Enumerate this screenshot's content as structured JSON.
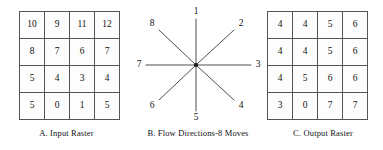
{
  "figure": {
    "panels": [
      {
        "id": "input",
        "caption": "A. Input Raster",
        "type": "raster",
        "rows": [
          [
            "10",
            "9",
            "11",
            "12"
          ],
          [
            "8",
            "7",
            "6",
            "7"
          ],
          [
            "5",
            "4",
            "3",
            "4"
          ],
          [
            "5",
            "0",
            "1",
            "5"
          ]
        ]
      },
      {
        "id": "flow",
        "caption": "B. Flow Directions-8 Moves",
        "type": "direction-star",
        "directions": [
          {
            "label": "1",
            "angle_deg": 90,
            "ray": "long"
          },
          {
            "label": "2",
            "angle_deg": 45,
            "ray": "short"
          },
          {
            "label": "3",
            "angle_deg": 0,
            "ray": "long"
          },
          {
            "label": "4",
            "angle_deg": -45,
            "ray": "short"
          },
          {
            "label": "5",
            "angle_deg": -90,
            "ray": "long"
          },
          {
            "label": "6",
            "angle_deg": 225,
            "ray": "short"
          },
          {
            "label": "7",
            "angle_deg": 180,
            "ray": "long"
          },
          {
            "label": "8",
            "angle_deg": 135,
            "ray": "short"
          }
        ]
      },
      {
        "id": "output",
        "caption": "C. Output Raster",
        "type": "raster",
        "rows": [
          [
            "4",
            "4",
            "5",
            "6"
          ],
          [
            "4",
            "4",
            "5",
            "6"
          ],
          [
            "4",
            "5",
            "6",
            "6"
          ],
          [
            "3",
            "0",
            "7",
            "7"
          ]
        ]
      }
    ],
    "colors": {
      "background": "#ffffff",
      "grid_line": "#555555",
      "grid_border": "#3b3b3b",
      "ray_stroke": "#3a3a3a",
      "hub_fill": "#1a1a1a",
      "text": "#111111"
    }
  }
}
